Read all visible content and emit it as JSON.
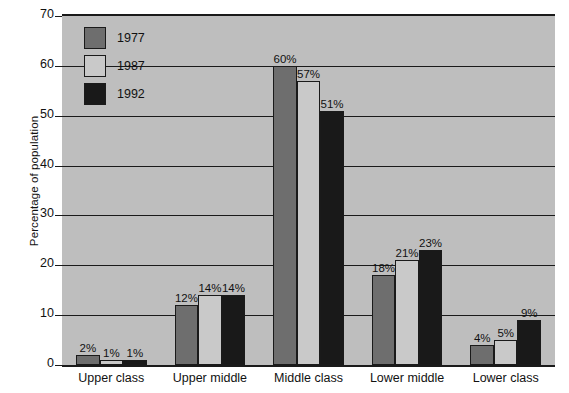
{
  "chart_data": {
    "type": "bar",
    "title": "",
    "xlabel": "",
    "ylabel": "Percentage of population",
    "ylim": [
      0,
      70
    ],
    "ytick_step": 10,
    "yticks": [
      "0",
      "10",
      "20",
      "30",
      "40",
      "50",
      "60",
      "70"
    ],
    "grid": true,
    "legend_position": "top-left-inside",
    "categories": [
      "Upper class",
      "Upper middle",
      "Middle class",
      "Lower middle",
      "Lower class"
    ],
    "series": [
      {
        "name": "1977",
        "color": "#6e6e6e",
        "values": [
          2,
          12,
          60,
          18,
          4
        ],
        "labels": [
          "2%",
          "12%",
          "60%",
          "18%",
          "4%"
        ]
      },
      {
        "name": "1987",
        "color": "#c9c9c9",
        "values": [
          1,
          14,
          57,
          21,
          5
        ],
        "labels": [
          "1%",
          "14%",
          "57%",
          "21%",
          "5%"
        ]
      },
      {
        "name": "1992",
        "color": "#191919",
        "values": [
          1,
          14,
          51,
          23,
          9
        ],
        "labels": [
          "1%",
          "14%",
          "51%",
          "23%",
          "9%"
        ]
      }
    ],
    "plot_background": "#bebebe",
    "axis_color": "#1a1a1a",
    "value_label_suffix": "%"
  },
  "legend": {
    "items": [
      {
        "label": "1977",
        "series_class": "y1977"
      },
      {
        "label": "1987",
        "series_class": "y1987"
      },
      {
        "label": "1992",
        "series_class": "y1992"
      }
    ]
  }
}
